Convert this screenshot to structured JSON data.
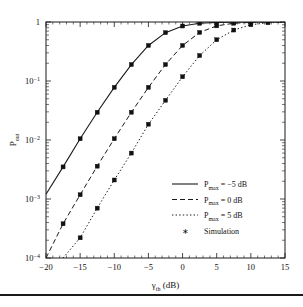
{
  "chart_data": {
    "type": "line",
    "title": "",
    "xlabel": "γth (dB)",
    "xlabel_base": "γ",
    "xlabel_sub": "th",
    "xlabel_unit": "(dB)",
    "ylabel": "Pout",
    "ylabel_base": "P",
    "ylabel_sub": "out",
    "xlim": [
      -20,
      15
    ],
    "ylim": [
      0.0001,
      1
    ],
    "yscale": "log",
    "xticks": [
      -20,
      -15,
      -10,
      -5,
      0,
      5,
      10,
      15
    ],
    "xtick_labels": [
      "−20",
      "−15",
      "−10",
      "−5",
      "0",
      "5",
      "10",
      "15"
    ],
    "yticks": [
      0.0001,
      0.001,
      0.01,
      0.1,
      1
    ],
    "ytick_labels": [
      "10−4",
      "10−3",
      "10−2",
      "10−1",
      "1"
    ],
    "grid": false,
    "legend_position": "lower right",
    "series": [
      {
        "name": "Pmax = −5 dB",
        "label_base": "P",
        "label_sub": "max",
        "label_rest": "= −5 dB",
        "style": "solid",
        "x": [
          -20,
          -17.5,
          -15,
          -12.5,
          -10,
          -7.5,
          -5,
          -2.5,
          0,
          2.5,
          5,
          7.5,
          10,
          12.5,
          15
        ],
        "y": [
          0.0012,
          0.0035,
          0.0105,
          0.0295,
          0.078,
          0.19,
          0.4,
          0.66,
          0.855,
          0.95,
          0.985,
          0.995,
          0.999,
          1.0,
          1.0
        ]
      },
      {
        "name": "Pmax = 0 dB",
        "label_base": "P",
        "label_sub": "max",
        "label_rest": "= 0 dB",
        "style": "dashed",
        "x": [
          -20,
          -17.5,
          -15,
          -12.5,
          -10,
          -7.5,
          -5,
          -2.5,
          0,
          2.5,
          5,
          7.5,
          10,
          12.5,
          15
        ],
        "y": [
          0.0001,
          0.00038,
          0.00118,
          0.0036,
          0.0105,
          0.0295,
          0.078,
          0.19,
          0.4,
          0.665,
          0.86,
          0.952,
          0.986,
          0.996,
          0.999
        ]
      },
      {
        "name": "Pmax = 5 dB",
        "label_base": "P",
        "label_sub": "max",
        "label_rest": "= 5 dB",
        "style": "dotted",
        "x": [
          -17.5,
          -15,
          -12.5,
          -10,
          -7.5,
          -5,
          -2.5,
          0,
          2.5,
          5,
          7.5,
          10,
          12.5,
          15
        ],
        "y": [
          0.0001,
          0.00022,
          0.0007,
          0.0021,
          0.006,
          0.0185,
          0.047,
          0.118,
          0.27,
          0.5,
          0.73,
          0.9,
          0.97,
          0.993
        ]
      }
    ],
    "simulation": {
      "name": "Simulation",
      "marker": "star",
      "points": [
        {
          "x": -17.5,
          "y": 0.0035
        },
        {
          "x": -15,
          "y": 0.0105
        },
        {
          "x": -12.5,
          "y": 0.0295
        },
        {
          "x": -10,
          "y": 0.078
        },
        {
          "x": -7.5,
          "y": 0.19
        },
        {
          "x": -5,
          "y": 0.4
        },
        {
          "x": -2.5,
          "y": 0.66
        },
        {
          "x": 0,
          "y": 0.855
        },
        {
          "x": 2.5,
          "y": 0.95
        },
        {
          "x": 5,
          "y": 0.985
        },
        {
          "x": 7.5,
          "y": 0.995
        },
        {
          "x": 10,
          "y": 0.999
        },
        {
          "x": -17.5,
          "y": 0.00038
        },
        {
          "x": -15,
          "y": 0.00118
        },
        {
          "x": -12.5,
          "y": 0.0036
        },
        {
          "x": -10,
          "y": 0.0105
        },
        {
          "x": -7.5,
          "y": 0.0295
        },
        {
          "x": -5,
          "y": 0.078
        },
        {
          "x": -2.5,
          "y": 0.19
        },
        {
          "x": 0,
          "y": 0.4
        },
        {
          "x": 2.5,
          "y": 0.665
        },
        {
          "x": 5,
          "y": 0.86
        },
        {
          "x": 7.5,
          "y": 0.952
        },
        {
          "x": 10,
          "y": 0.986
        },
        {
          "x": -15,
          "y": 0.00022
        },
        {
          "x": -12.5,
          "y": 0.0007
        },
        {
          "x": -10,
          "y": 0.0021
        },
        {
          "x": -7.5,
          "y": 0.006
        },
        {
          "x": -5,
          "y": 0.0185
        },
        {
          "x": -2.5,
          "y": 0.047
        },
        {
          "x": 0,
          "y": 0.118
        },
        {
          "x": 2.5,
          "y": 0.27
        },
        {
          "x": 5,
          "y": 0.5
        },
        {
          "x": 7.5,
          "y": 0.73
        },
        {
          "x": 10,
          "y": 0.9
        },
        {
          "x": 12.5,
          "y": 0.97
        }
      ]
    }
  },
  "legend": {
    "entries": [
      {
        "label": "Pmax = −5 dB",
        "style": "solid"
      },
      {
        "label": "Pmax = 0 dB",
        "style": "dashed"
      },
      {
        "label": "Pmax = 5 dB",
        "style": "dotted"
      },
      {
        "label": "Simulation",
        "style": "marker"
      }
    ]
  },
  "colors": {
    "axis": "#1a1a1a",
    "curve": "#1a1a1a",
    "marker": "#111111",
    "background": "#ffffff"
  }
}
